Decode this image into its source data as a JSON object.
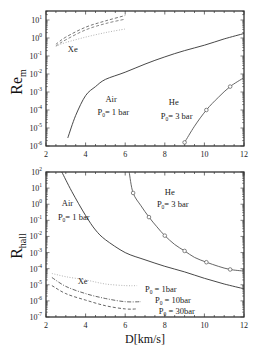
{
  "chart_data": [
    {
      "type": "line",
      "panel": "top",
      "ylabel": "Re",
      "ylabel_sub": "m",
      "xlabel": "",
      "xlim": [
        2,
        12
      ],
      "ylim_log10": [
        -6,
        1.5
      ],
      "yscale": "log",
      "x_ticks": [
        "2",
        "4",
        "6",
        "8",
        "10",
        "12"
      ],
      "x_tick_values": [
        2,
        4,
        6,
        8,
        10,
        12
      ],
      "y_tick_exponents": [
        1,
        0,
        -1,
        -2,
        -3,
        -4,
        -5,
        -6
      ],
      "series": [
        {
          "name": "Air P0=1 bar",
          "style": "solid",
          "color": "#333333",
          "x": [
            3.1,
            3.5,
            4,
            4.5,
            5,
            6,
            7,
            8,
            9,
            10,
            11,
            12
          ],
          "log10y": [
            -5.55,
            -4.3,
            -3.2,
            -2.7,
            -2.3,
            -1.9,
            -1.45,
            -1.05,
            -0.7,
            -0.4,
            -0.05,
            0.25
          ]
        },
        {
          "name": "He P0=3 bar",
          "style": "solid-markers",
          "color": "#555555",
          "x": [
            9.0,
            9.5,
            10.1,
            10.7,
            11.3,
            12.0
          ],
          "log10y": [
            -5.8,
            -4.9,
            -4.0,
            -3.3,
            -2.7,
            -2.2
          ],
          "markers": [
            0,
            2,
            4
          ]
        },
        {
          "name": "Xe upper dashed",
          "style": "dashed",
          "color": "#666666",
          "x": [
            2.5,
            3,
            4,
            5,
            6
          ],
          "log10y": [
            -0.35,
            0.05,
            0.6,
            0.95,
            1.25
          ]
        },
        {
          "name": "Xe lower dashed",
          "style": "dashed",
          "color": "#777777",
          "x": [
            2.5,
            3,
            4,
            5,
            6
          ],
          "log10y": [
            -0.45,
            -0.1,
            0.45,
            0.8,
            1.05
          ]
        },
        {
          "name": "Xe dotted",
          "style": "dotted",
          "color": "#aaaaaa",
          "x": [
            2.5,
            3,
            4,
            5,
            6
          ],
          "log10y": [
            -0.45,
            -0.25,
            0.05,
            0.3,
            0.5
          ]
        }
      ],
      "annotations": [
        {
          "text": "Xe",
          "x": 3.1,
          "log10y": -0.75
        },
        {
          "text": "Air",
          "x": 5.0,
          "log10y": -3.55
        },
        {
          "text": "P",
          "sub": "0",
          "rest": "= 1 bar",
          "x": 4.6,
          "log10y": -4.3
        },
        {
          "text": "He",
          "x": 8.2,
          "log10y": -3.7
        },
        {
          "text": "P",
          "sub": "0",
          "rest": "= 3 bar",
          "x": 7.8,
          "log10y": -4.5
        }
      ]
    },
    {
      "type": "line",
      "panel": "bottom",
      "ylabel": "R",
      "ylabel_sub": "hall",
      "xlabel": "D[km/s]",
      "xlim": [
        2,
        12
      ],
      "ylim_log10": [
        -7,
        2
      ],
      "yscale": "log",
      "x_ticks": [
        "2",
        "4",
        "6",
        "8",
        "10",
        "12"
      ],
      "x_tick_values": [
        2,
        4,
        6,
        8,
        10,
        12
      ],
      "y_tick_exponents": [
        2,
        1,
        0,
        -1,
        -2,
        -3,
        -4,
        -5,
        -6,
        -7
      ],
      "series": [
        {
          "name": "Air P0=1 bar",
          "style": "solid",
          "color": "#333333",
          "x": [
            2.8,
            3.3,
            4,
            4.5,
            5,
            6,
            7,
            8,
            9,
            10,
            11,
            12
          ],
          "log10y": [
            2.0,
            0.8,
            -0.7,
            -1.6,
            -2.2,
            -3.0,
            -3.45,
            -3.85,
            -4.2,
            -4.6,
            -4.95,
            -5.25
          ]
        },
        {
          "name": "He P0=3 bar",
          "style": "solid-markers",
          "color": "#555555",
          "x": [
            6.2,
            6.4,
            6.8,
            7.2,
            7.6,
            8.0,
            8.5,
            9.0,
            9.5,
            10.1,
            10.7,
            11.3,
            12.0
          ],
          "log10y": [
            2.0,
            0.7,
            -0.1,
            -0.8,
            -1.4,
            -1.95,
            -2.5,
            -2.9,
            -3.3,
            -3.6,
            -3.85,
            -4.05,
            -4.15
          ],
          "markers": [
            1,
            3,
            5,
            7,
            9,
            11
          ]
        },
        {
          "name": "Xe P0 = 1bar",
          "style": "dotted",
          "color": "#aaaaaa",
          "x": [
            2.3,
            3,
            4,
            5,
            6,
            6.6
          ],
          "log10y": [
            -4.3,
            -4.5,
            -4.7,
            -4.95,
            -5.05,
            -5.05
          ]
        },
        {
          "name": "Xe P0 = 10bar",
          "style": "dashdot",
          "color": "#555555",
          "x": [
            2.3,
            3,
            4,
            5,
            6,
            6.8
          ],
          "log10y": [
            -4.55,
            -5.1,
            -5.55,
            -5.85,
            -6.05,
            -6.05
          ]
        },
        {
          "name": "Xe P0 = 30bar",
          "style": "dashed",
          "color": "#555555",
          "x": [
            2.3,
            3,
            4,
            5,
            6,
            6.6
          ],
          "log10y": [
            -5.05,
            -5.55,
            -5.95,
            -6.3,
            -6.5,
            -6.5
          ]
        }
      ],
      "annotations": [
        {
          "text": "Air",
          "x": 2.8,
          "log10y": -0.1
        },
        {
          "text": "P",
          "sub": "0",
          "rest": "= 1 bar",
          "x": 2.6,
          "log10y": -0.95
        },
        {
          "text": "He",
          "x": 8.0,
          "log10y": 0.6
        },
        {
          "text": "P",
          "sub": "0",
          "rest": "= 3 bar",
          "x": 7.6,
          "log10y": -0.2
        },
        {
          "text": "Xe",
          "x": 3.6,
          "log10y": -4.95
        },
        {
          "text": "P",
          "sub": "0",
          "rest": " = 1bar",
          "x": 7.0,
          "log10y": -5.45
        },
        {
          "text": "P",
          "sub": "0",
          "rest": " = 10bar",
          "x": 7.5,
          "log10y": -6.15
        },
        {
          "text": "P",
          "sub": "0",
          "rest": " = 30bar",
          "x": 7.7,
          "log10y": -6.8
        }
      ]
    }
  ]
}
